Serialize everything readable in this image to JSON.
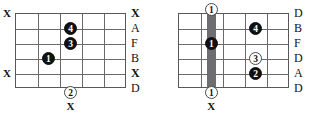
{
  "page": {
    "width": 320,
    "height": 121,
    "background": "#ffffff",
    "ink_color": "#111111",
    "grid_color": "#6a6a6c",
    "barre_color": "#6e6e70"
  },
  "diagrams": [
    {
      "id": "left-chord-diagram",
      "name": "chord-diagram-left",
      "strings": 6,
      "frets": 5,
      "board": {
        "left": 15,
        "top": 13,
        "width": 111,
        "height": 75
      },
      "barre": null,
      "left_marks": [
        {
          "name": "mute-mark-string-1",
          "text": "X",
          "string": 1
        },
        {
          "name": "mute-mark-string-5",
          "text": "X",
          "string": 5
        }
      ],
      "right_labels": [
        {
          "name": "string-label-1",
          "text": "X",
          "string": 1,
          "bold": true
        },
        {
          "name": "string-label-2",
          "text": "A",
          "string": 2,
          "bold": false
        },
        {
          "name": "string-label-3",
          "text": "F",
          "string": 3,
          "bold": false
        },
        {
          "name": "string-label-4",
          "text": "B",
          "string": 4,
          "bold": false
        },
        {
          "name": "string-label-5",
          "text": "X",
          "string": 5,
          "bold": true
        },
        {
          "name": "string-label-6",
          "text": "D",
          "string": 6,
          "bold": false
        }
      ],
      "dots": [
        {
          "name": "finger-dot-4",
          "finger": "4",
          "style": "filled",
          "string": 2,
          "fret": 3
        },
        {
          "name": "finger-dot-3",
          "finger": "3",
          "style": "filled",
          "string": 3,
          "fret": 3
        },
        {
          "name": "finger-dot-1",
          "finger": "1",
          "style": "filled",
          "string": 4,
          "fret": 2
        }
      ],
      "below_dots": [
        {
          "name": "finger-dot-2-below",
          "finger": "2",
          "style": "open",
          "fret": 3,
          "offset_y": 4
        }
      ],
      "below_marks": [
        {
          "name": "mute-mark-below",
          "text": "X",
          "fret": 3,
          "offset_y": 18
        }
      ]
    },
    {
      "id": "right-chord-diagram",
      "name": "chord-diagram-right",
      "strings": 6,
      "frets": 5,
      "board": {
        "left": 18,
        "top": 13,
        "width": 111,
        "height": 75
      },
      "barre": {
        "name": "barre-bar",
        "fret": 2,
        "top_offset": -4,
        "bottom_offset": 4,
        "width": 9
      },
      "left_marks": [],
      "right_labels": [
        {
          "name": "string-label-1",
          "text": "D",
          "string": 1,
          "bold": false
        },
        {
          "name": "string-label-2",
          "text": "B",
          "string": 2,
          "bold": false
        },
        {
          "name": "string-label-3",
          "text": "F",
          "string": 3,
          "bold": false
        },
        {
          "name": "string-label-4",
          "text": "D",
          "string": 4,
          "bold": false
        },
        {
          "name": "string-label-5",
          "text": "A",
          "string": 5,
          "bold": false
        },
        {
          "name": "string-label-6",
          "text": "D",
          "string": 6,
          "bold": false
        }
      ],
      "dots": [
        {
          "name": "barre-dot-top",
          "finger": "1",
          "style": "open",
          "string": 1,
          "fret": 2,
          "offset_y": -4
        },
        {
          "name": "barre-dot-middle",
          "finger": "1",
          "style": "filled",
          "string": 3,
          "fret": 2
        },
        {
          "name": "barre-dot-bottom",
          "finger": "1",
          "style": "open",
          "string": 6,
          "fret": 2,
          "offset_y": 4
        },
        {
          "name": "finger-dot-4",
          "finger": "4",
          "style": "filled",
          "string": 2,
          "fret": 4
        },
        {
          "name": "finger-dot-3",
          "finger": "3",
          "style": "open",
          "string": 4,
          "fret": 4
        },
        {
          "name": "finger-dot-2",
          "finger": "2",
          "style": "filled",
          "string": 5,
          "fret": 4
        }
      ],
      "below_dots": [],
      "below_marks": [
        {
          "name": "mute-mark-below",
          "text": "X",
          "fret": 2,
          "offset_y": 18
        }
      ]
    }
  ]
}
